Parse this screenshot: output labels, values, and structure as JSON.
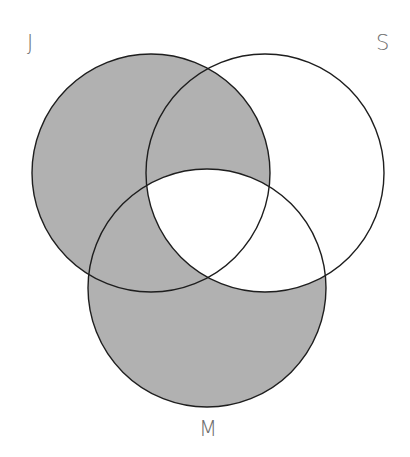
{
  "diagram": {
    "type": "venn",
    "sets": [
      {
        "id": "J",
        "label": "J",
        "cx": 151,
        "cy": 173,
        "r": 119
      },
      {
        "id": "S",
        "label": "S",
        "cx": 265,
        "cy": 173,
        "r": 119
      },
      {
        "id": "M",
        "label": "M",
        "cx": 207,
        "cy": 288,
        "r": 119
      }
    ],
    "shaded_regions": [
      "J only",
      "J∩S only",
      "J∩M only",
      "M only"
    ],
    "unshaded_regions": [
      "S only",
      "S∩M only",
      "J∩S∩M"
    ],
    "colors": {
      "shade": "#b1b1b1",
      "stroke": "#1e1e1e",
      "background": "#ffffff",
      "label": "#6e6e6e"
    }
  }
}
